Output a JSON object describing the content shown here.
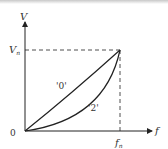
{
  "diagram": {
    "y_axis_label": "V",
    "x_axis_label": "f",
    "origin_label": "0",
    "v_rated_label": "V",
    "v_rated_sub": "n",
    "f_rated_label": "f",
    "f_rated_sub": "n",
    "curve_labels": [
      "'0'",
      "'2'"
    ],
    "line_color": "#222222"
  }
}
